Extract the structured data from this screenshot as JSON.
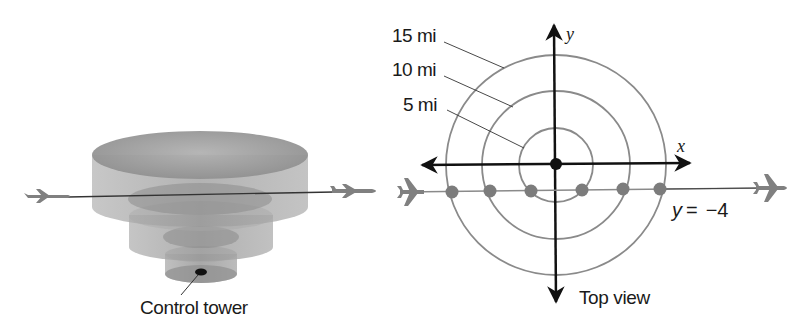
{
  "left_view": {
    "caption": "Control tower",
    "cylinders": [
      {
        "name": "outer-15mi",
        "cx": 200,
        "top_y": 155,
        "rx": 108,
        "ry": 24,
        "height": 58
      },
      {
        "name": "middle-10mi",
        "cx": 201,
        "top_y": 200,
        "rx": 72,
        "ry": 16,
        "height": 38
      },
      {
        "name": "inner-5mi",
        "cx": 201,
        "top_y": 246,
        "rx": 36,
        "ry": 9,
        "height": 28
      }
    ],
    "flight_path": {
      "x1": 70,
      "y1": 197,
      "x2": 332,
      "y2": 192
    }
  },
  "top_view": {
    "caption": "Top view",
    "axis_x_label": "x",
    "axis_y_label": "y",
    "equation": {
      "lhs": "y",
      "op": "=",
      "rhs": "−4"
    },
    "rings": [
      {
        "label": "15 mi",
        "radius_mi": 15
      },
      {
        "label": "10 mi",
        "radius_mi": 10
      },
      {
        "label": "5 mi",
        "radius_mi": 5
      }
    ],
    "flight_line_y": -4,
    "intersection_points": [
      {
        "x": -14.4,
        "y": -4
      },
      {
        "x": -9.2,
        "y": -4
      },
      {
        "x": -3.0,
        "y": -4
      },
      {
        "x": 3.0,
        "y": -4
      },
      {
        "x": 9.2,
        "y": -4
      },
      {
        "x": 14.4,
        "y": -4
      }
    ]
  },
  "colors": {
    "ring": "#8a8a8a",
    "axis": "#111111",
    "point": "#7c7c7c",
    "plane": "#808080",
    "cylinder": "#9a9a9a"
  }
}
